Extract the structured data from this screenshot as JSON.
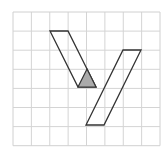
{
  "diagram": {
    "type": "grid-geometry",
    "grid": {
      "columns": 8,
      "rows": 7,
      "origin_x": 13,
      "origin_y": 12,
      "cell_w": 18.375,
      "cell_h": 19.1,
      "line_color": "#d4d4d4",
      "border_color": "#d0d0d0"
    },
    "shapes": [
      {
        "name": "left-parallelogram",
        "points": "50,31 68,31 96,87 78,87",
        "fill": "none",
        "stroke": "#333333"
      },
      {
        "name": "right-parallelogram",
        "points": "123,50 141,50 104,125 86,125",
        "fill": "none",
        "stroke": "#333333"
      },
      {
        "name": "shaded-triangle",
        "points": "87,69 96,87 78,87",
        "fill": "#aaaaaa",
        "stroke": "#333333"
      }
    ]
  }
}
